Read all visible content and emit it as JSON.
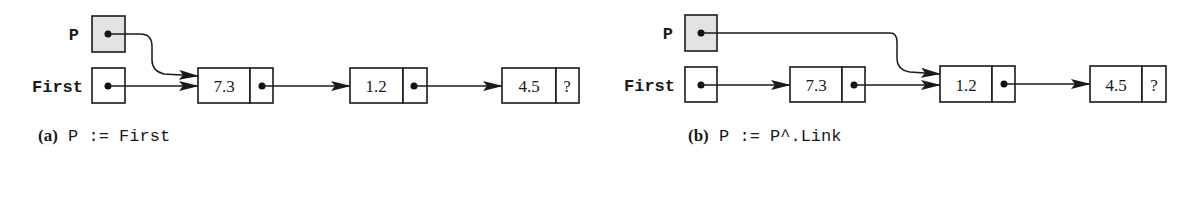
{
  "figure": {
    "panel_a": {
      "caption_label": "(a)",
      "caption_code": "P := First",
      "pointers": [
        {
          "name": "P",
          "shaded": true,
          "points_to_node": 0
        },
        {
          "name": "First",
          "shaded": false,
          "points_to_node": 0
        }
      ],
      "nodes": [
        {
          "value": "7.3",
          "link": "next"
        },
        {
          "value": "1.2",
          "link": "next"
        },
        {
          "value": "4.5",
          "link": "?"
        }
      ]
    },
    "panel_b": {
      "caption_label": "(b)",
      "caption_code": "P := P^.Link",
      "pointers": [
        {
          "name": "P",
          "shaded": true,
          "points_to_node": 1
        },
        {
          "name": "First",
          "shaded": false,
          "points_to_node": 0
        }
      ],
      "nodes": [
        {
          "value": "7.3",
          "link": "next"
        },
        {
          "value": "1.2",
          "link": "next"
        },
        {
          "value": "4.5",
          "link": "?"
        }
      ]
    },
    "colors": {
      "line": "#1a1a1a",
      "pointer_shade": "#e3e3e3",
      "background": "#ffffff"
    }
  }
}
